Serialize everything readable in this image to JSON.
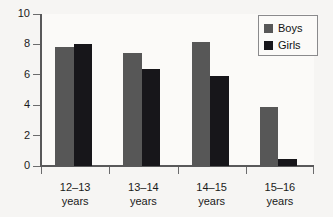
{
  "chart_data": {
    "type": "bar",
    "title": "",
    "subtitle": "",
    "xlabel": "",
    "ylabel": "",
    "categories": [
      "12–13\nyears",
      "13–14\nyears",
      "14–15\nyears",
      "15–16\nyears"
    ],
    "category_lines": [
      [
        "12–13",
        "years"
      ],
      [
        "13–14",
        "years"
      ],
      [
        "14–15",
        "years"
      ],
      [
        "15–16",
        "years"
      ]
    ],
    "series": [
      {
        "name": "Boys",
        "color": "#575757",
        "values": [
          7.85,
          7.45,
          8.15,
          3.85
        ]
      },
      {
        "name": "Girls",
        "color": "#17161a",
        "values": [
          8.0,
          6.4,
          5.9,
          0.45
        ]
      }
    ],
    "ylim": [
      0,
      10
    ],
    "yticks": [
      0,
      2,
      4,
      6,
      8,
      10
    ],
    "ytick_labels": [
      "0",
      "2",
      "4",
      "6",
      "8",
      "10"
    ],
    "grid": false,
    "legend_position": "top-right",
    "legend_entries": [
      "Boys",
      "Girls"
    ],
    "annotations": []
  },
  "axes": {
    "y_axis_name": "y-axis",
    "x_axis_name": "x-axis"
  },
  "colors": {
    "background": "#f6f5f3",
    "plot_background": "#fbfaf8",
    "axis": "#59595a",
    "boys": "#575757",
    "girls": "#17161a",
    "text": "#1a1a1a",
    "legend_border": "#8a8a8c"
  }
}
